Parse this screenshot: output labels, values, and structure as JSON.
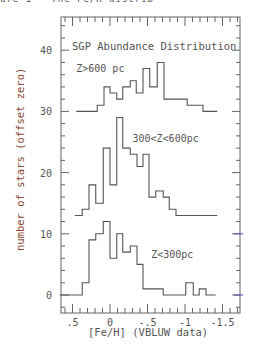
{
  "header_fragment": "ure 1 - The Fe/H distrib",
  "chart_data": {
    "type": "bar",
    "subtype": "step-histogram (stacked with offsets)",
    "title": "SGP Abundance Distribution",
    "xlabel": "[Fe/H] (VBLUW data)",
    "ylabel": "number of stars (offset zero)",
    "xlim": [
      0.85,
      -1.75
    ],
    "ylim": [
      -3,
      45
    ],
    "x_inverted": true,
    "xticks": [
      0.5,
      0,
      -0.5,
      -1,
      -1.5
    ],
    "xtick_labels": [
      ".5",
      "0",
      "-.5",
      "-1",
      "-1.5"
    ],
    "yticks": [
      0,
      10,
      20,
      30,
      40
    ],
    "ytick_labels": [
      "0",
      "10",
      "20",
      "30",
      "40"
    ],
    "grid": false,
    "legend": "none (inline labels)",
    "series": [
      {
        "name": "Z>600 pc",
        "offset": 30,
        "label_pos": [
          0.45,
          36.5
        ],
        "edges": [
          0.45,
          0.17,
          0.08,
          0.0,
          -0.09,
          -0.17,
          -0.27,
          -0.35,
          -0.44,
          -0.53,
          -0.63,
          -0.72,
          -1.03,
          -1.24,
          -1.43
        ],
        "counts": [
          0,
          1,
          4,
          3,
          2,
          4,
          5,
          3,
          7,
          4,
          8,
          2,
          1,
          0
        ]
      },
      {
        "name": "300<Z<600pc",
        "offset": 10,
        "label_pos": [
          -0.3,
          25
        ],
        "edges": [
          0.47,
          0.37,
          0.28,
          0.19,
          0.09,
          0.0,
          -0.09,
          -0.17,
          -0.27,
          -0.36,
          -0.44,
          -0.52,
          -0.61,
          -0.71,
          -0.79,
          -0.88,
          -1.43
        ],
        "counts": [
          3,
          4,
          8,
          5,
          14,
          8,
          19,
          14,
          13,
          11,
          13,
          6,
          7,
          6,
          4,
          3
        ]
      },
      {
        "name": "Z<300pc",
        "offset": 0,
        "label_pos": [
          -0.55,
          6
        ],
        "edges": [
          0.67,
          0.37,
          0.28,
          0.19,
          0.09,
          0.0,
          -0.09,
          -0.17,
          -0.27,
          -0.36,
          -0.44,
          -0.71,
          -1.01,
          -1.11,
          -1.19,
          -1.28,
          -1.41
        ],
        "counts": [
          0,
          2,
          9,
          10,
          12,
          6,
          10,
          7,
          8,
          5,
          1,
          0,
          2,
          0,
          1,
          0
        ]
      }
    ]
  }
}
